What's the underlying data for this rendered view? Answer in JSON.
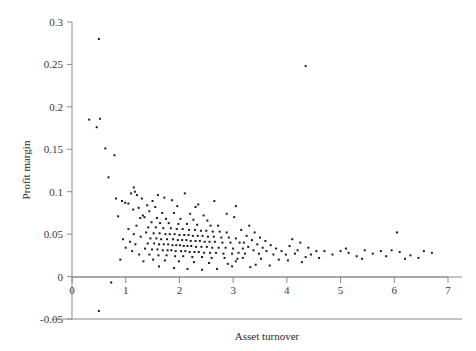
{
  "chart_data": {
    "type": "scatter",
    "title": "",
    "xlabel": "Asset turnover",
    "ylabel": "Profit margin",
    "xlim": [
      0,
      7
    ],
    "ylim": [
      -0.05,
      0.3
    ],
    "xticks": [
      "0",
      "1",
      "2",
      "3",
      "4",
      "5",
      "6",
      "7"
    ],
    "xtick_values": [
      0,
      1,
      2,
      3,
      4,
      5,
      6,
      7
    ],
    "yticks": [
      "-0.05",
      "0",
      "0.05",
      "0.1",
      "0.15",
      "0.2",
      "0.25",
      "0.3"
    ],
    "ytick_values": [
      -0.05,
      0,
      0.05,
      0.1,
      0.15,
      0.2,
      0.25,
      0.3
    ],
    "grid": false,
    "legend": null,
    "marker": "square",
    "marker_color": "#1c1c1c",
    "marker_size": 2,
    "zero_line": true,
    "n_points": 232,
    "points": [
      [
        0.5,
        0.28
      ],
      [
        4.35,
        0.248
      ],
      [
        0.32,
        0.185
      ],
      [
        0.52,
        0.186
      ],
      [
        0.46,
        0.176
      ],
      [
        0.62,
        0.151
      ],
      [
        0.79,
        0.143
      ],
      [
        0.68,
        0.117
      ],
      [
        1.1,
        0.098
      ],
      [
        1.17,
        0.1
      ],
      [
        1.21,
        0.096
      ],
      [
        1.3,
        0.092
      ],
      [
        0.93,
        0.089
      ],
      [
        0.99,
        0.087
      ],
      [
        1.05,
        0.086
      ],
      [
        1.24,
        0.081
      ],
      [
        1.14,
        0.079
      ],
      [
        0.86,
        0.071
      ],
      [
        1.32,
        0.072
      ],
      [
        1.27,
        0.069
      ],
      [
        2.1,
        0.098
      ],
      [
        1.6,
        0.096
      ],
      [
        1.72,
        0.093
      ],
      [
        1.5,
        0.089
      ],
      [
        1.86,
        0.09
      ],
      [
        1.4,
        0.084
      ],
      [
        1.55,
        0.082
      ],
      [
        1.96,
        0.083
      ],
      [
        2.3,
        0.082
      ],
      [
        1.44,
        0.077
      ],
      [
        1.68,
        0.075
      ],
      [
        1.9,
        0.075
      ],
      [
        2.2,
        0.074
      ],
      [
        2.45,
        0.072
      ],
      [
        1.35,
        0.07
      ],
      [
        1.58,
        0.069
      ],
      [
        1.75,
        0.068
      ],
      [
        2.02,
        0.068
      ],
      [
        2.26,
        0.067
      ],
      [
        2.52,
        0.066
      ],
      [
        1.48,
        0.064
      ],
      [
        1.64,
        0.063
      ],
      [
        1.8,
        0.063
      ],
      [
        1.98,
        0.062
      ],
      [
        2.14,
        0.062
      ],
      [
        2.33,
        0.061
      ],
      [
        2.58,
        0.06
      ],
      [
        2.72,
        0.06
      ],
      [
        1.42,
        0.058
      ],
      [
        1.56,
        0.058
      ],
      [
        1.7,
        0.057
      ],
      [
        1.84,
        0.057
      ],
      [
        1.95,
        0.056
      ],
      [
        2.06,
        0.056
      ],
      [
        2.18,
        0.055
      ],
      [
        2.29,
        0.055
      ],
      [
        2.4,
        0.054
      ],
      [
        2.5,
        0.054
      ],
      [
        2.62,
        0.053
      ],
      [
        2.75,
        0.053
      ],
      [
        2.88,
        0.052
      ],
      [
        1.38,
        0.052
      ],
      [
        1.52,
        0.051
      ],
      [
        1.63,
        0.051
      ],
      [
        1.74,
        0.05
      ],
      [
        1.82,
        0.05
      ],
      [
        1.91,
        0.05
      ],
      [
        2.0,
        0.049
      ],
      [
        2.09,
        0.049
      ],
      [
        2.17,
        0.049
      ],
      [
        2.25,
        0.048
      ],
      [
        2.34,
        0.048
      ],
      [
        2.43,
        0.048
      ],
      [
        2.53,
        0.047
      ],
      [
        2.64,
        0.047
      ],
      [
        2.78,
        0.046
      ],
      [
        2.92,
        0.046
      ],
      [
        3.05,
        0.045
      ],
      [
        1.46,
        0.045
      ],
      [
        1.57,
        0.045
      ],
      [
        1.66,
        0.044
      ],
      [
        1.77,
        0.044
      ],
      [
        1.88,
        0.044
      ],
      [
        1.97,
        0.043
      ],
      [
        2.05,
        0.043
      ],
      [
        2.13,
        0.043
      ],
      [
        2.21,
        0.042
      ],
      [
        2.3,
        0.042
      ],
      [
        2.38,
        0.042
      ],
      [
        2.47,
        0.041
      ],
      [
        2.56,
        0.041
      ],
      [
        2.66,
        0.041
      ],
      [
        2.8,
        0.04
      ],
      [
        2.95,
        0.04
      ],
      [
        3.12,
        0.04
      ],
      [
        1.41,
        0.039
      ],
      [
        1.53,
        0.039
      ],
      [
        1.62,
        0.038
      ],
      [
        1.71,
        0.038
      ],
      [
        1.79,
        0.038
      ],
      [
        1.87,
        0.037
      ],
      [
        1.94,
        0.037
      ],
      [
        2.01,
        0.037
      ],
      [
        2.08,
        0.036
      ],
      [
        2.15,
        0.036
      ],
      [
        2.22,
        0.036
      ],
      [
        2.31,
        0.035
      ],
      [
        2.41,
        0.035
      ],
      [
        2.51,
        0.035
      ],
      [
        2.61,
        0.034
      ],
      [
        2.73,
        0.034
      ],
      [
        2.86,
        0.034
      ],
      [
        3.0,
        0.033
      ],
      [
        3.18,
        0.033
      ],
      [
        1.36,
        0.033
      ],
      [
        1.49,
        0.032
      ],
      [
        1.59,
        0.032
      ],
      [
        1.69,
        0.031
      ],
      [
        1.78,
        0.031
      ],
      [
        1.85,
        0.031
      ],
      [
        1.93,
        0.03
      ],
      [
        2.03,
        0.03
      ],
      [
        2.11,
        0.03
      ],
      [
        2.19,
        0.029
      ],
      [
        2.28,
        0.029
      ],
      [
        2.36,
        0.029
      ],
      [
        2.46,
        0.028
      ],
      [
        2.57,
        0.028
      ],
      [
        2.68,
        0.028
      ],
      [
        2.82,
        0.027
      ],
      [
        2.98,
        0.027
      ],
      [
        3.22,
        0.027
      ],
      [
        1.44,
        0.026
      ],
      [
        1.61,
        0.025
      ],
      [
        1.76,
        0.025
      ],
      [
        1.92,
        0.024
      ],
      [
        2.07,
        0.024
      ],
      [
        2.24,
        0.023
      ],
      [
        2.42,
        0.023
      ],
      [
        2.6,
        0.022
      ],
      [
        2.84,
        0.022
      ],
      [
        3.08,
        0.021
      ],
      [
        1.51,
        0.02
      ],
      [
        1.73,
        0.019
      ],
      [
        1.99,
        0.018
      ],
      [
        2.27,
        0.017
      ],
      [
        2.55,
        0.016
      ],
      [
        2.9,
        0.015
      ],
      [
        1.2,
        0.06
      ],
      [
        1.05,
        0.056
      ],
      [
        1.15,
        0.05
      ],
      [
        1.28,
        0.047
      ],
      [
        0.95,
        0.044
      ],
      [
        1.08,
        0.041
      ],
      [
        1.18,
        0.038
      ],
      [
        1.0,
        0.034
      ],
      [
        1.12,
        0.03
      ],
      [
        1.25,
        0.026
      ],
      [
        0.9,
        0.02
      ],
      [
        1.33,
        0.018
      ],
      [
        1.62,
        0.012
      ],
      [
        1.9,
        0.01
      ],
      [
        2.15,
        0.009
      ],
      [
        2.42,
        0.008
      ],
      [
        2.7,
        0.009
      ],
      [
        3.3,
        0.06
      ],
      [
        3.15,
        0.055
      ],
      [
        3.4,
        0.052
      ],
      [
        3.25,
        0.048
      ],
      [
        3.5,
        0.046
      ],
      [
        3.35,
        0.043
      ],
      [
        3.6,
        0.042
      ],
      [
        3.2,
        0.04
      ],
      [
        3.45,
        0.038
      ],
      [
        3.7,
        0.037
      ],
      [
        3.28,
        0.035
      ],
      [
        3.55,
        0.034
      ],
      [
        3.8,
        0.033
      ],
      [
        3.38,
        0.031
      ],
      [
        3.62,
        0.03
      ],
      [
        3.9,
        0.03
      ],
      [
        3.1,
        0.028
      ],
      [
        3.48,
        0.027
      ],
      [
        3.75,
        0.026
      ],
      [
        3.98,
        0.026
      ],
      [
        3.18,
        0.022
      ],
      [
        3.52,
        0.021
      ],
      [
        3.85,
        0.02
      ],
      [
        3.05,
        0.018
      ],
      [
        3.42,
        0.014
      ],
      [
        3.68,
        0.013
      ],
      [
        2.88,
        0.074
      ],
      [
        3.02,
        0.07
      ],
      [
        2.98,
        0.012
      ],
      [
        3.32,
        0.011
      ],
      [
        4.1,
        0.044
      ],
      [
        4.25,
        0.04
      ],
      [
        4.05,
        0.036
      ],
      [
        4.4,
        0.034
      ],
      [
        4.2,
        0.031
      ],
      [
        4.55,
        0.03
      ],
      [
        4.15,
        0.027
      ],
      [
        4.45,
        0.026
      ],
      [
        4.7,
        0.03
      ],
      [
        4.35,
        0.023
      ],
      [
        4.6,
        0.022
      ],
      [
        4.02,
        0.019
      ],
      [
        4.28,
        0.017
      ],
      [
        4.85,
        0.026
      ],
      [
        5.0,
        0.03
      ],
      [
        5.15,
        0.028
      ],
      [
        5.1,
        0.033
      ],
      [
        5.3,
        0.024
      ],
      [
        5.45,
        0.031
      ],
      [
        5.4,
        0.021
      ],
      [
        5.6,
        0.027
      ],
      [
        5.75,
        0.03
      ],
      [
        5.85,
        0.024
      ],
      [
        5.95,
        0.031
      ],
      [
        6.05,
        0.052
      ],
      [
        6.1,
        0.029
      ],
      [
        6.2,
        0.021
      ],
      [
        6.3,
        0.025
      ],
      [
        6.55,
        0.03
      ],
      [
        6.7,
        0.028
      ],
      [
        6.45,
        0.022
      ],
      [
        0.73,
        -0.007
      ],
      [
        0.5,
        -0.0405
      ],
      [
        1.15,
        0.105
      ],
      [
        0.82,
        0.092
      ],
      [
        2.65,
        0.089
      ],
      [
        3.05,
        0.083
      ],
      [
        2.35,
        0.085
      ]
    ]
  }
}
